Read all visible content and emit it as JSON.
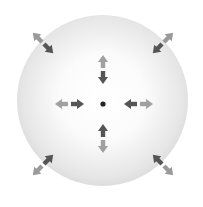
{
  "diagram": {
    "type": "sphere-with-force-arrows",
    "center_dot": "center-point",
    "colors": {
      "sphere_edge": "#bdbdbd",
      "sphere_center": "#ffffff",
      "arrow_dark": "#555555",
      "arrow_light": "#9a9a9a",
      "dot": "#222222"
    },
    "arrows": [
      {
        "position": "top-left-edge",
        "dark": "inward",
        "light": "outward"
      },
      {
        "position": "top-right-edge",
        "dark": "inward",
        "light": "outward"
      },
      {
        "position": "bottom-left-edge",
        "dark": "inward",
        "light": "outward"
      },
      {
        "position": "bottom-right-edge",
        "dark": "inward",
        "light": "outward"
      },
      {
        "position": "inner-top",
        "dark": "toward-center",
        "light": "away-from-center"
      },
      {
        "position": "inner-bottom",
        "dark": "toward-center",
        "light": "away-from-center"
      },
      {
        "position": "inner-left",
        "dark": "toward-center",
        "light": "away-from-center"
      },
      {
        "position": "inner-right",
        "dark": "toward-center",
        "light": "away-from-center"
      }
    ]
  }
}
